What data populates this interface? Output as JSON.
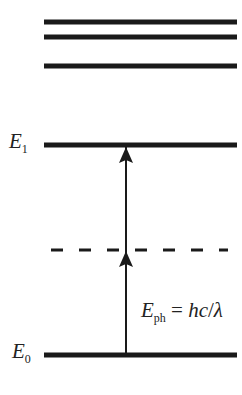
{
  "diagram": {
    "type": "energy-level-diagram",
    "colors": {
      "line": "#1a1a1a",
      "background": "#ffffff"
    },
    "levels": [
      {
        "name": "upper-level-3",
        "y": 22,
        "style": "solid"
      },
      {
        "name": "upper-level-2",
        "y": 37,
        "style": "solid"
      },
      {
        "name": "upper-level-1",
        "y": 66,
        "style": "solid"
      },
      {
        "name": "E1",
        "y": 145,
        "style": "solid",
        "label_main": "E",
        "label_sub": "1"
      },
      {
        "name": "virtual-level",
        "y": 250,
        "style": "dashed"
      },
      {
        "name": "E0",
        "y": 355,
        "style": "solid",
        "label_main": "E",
        "label_sub": "0"
      }
    ],
    "photon_energy_label": {
      "main": "E",
      "sub": "ph",
      "rest_eq": " = ",
      "rest_hc": "hc",
      "rest_slash": "/",
      "rest_lambda": "λ"
    }
  }
}
